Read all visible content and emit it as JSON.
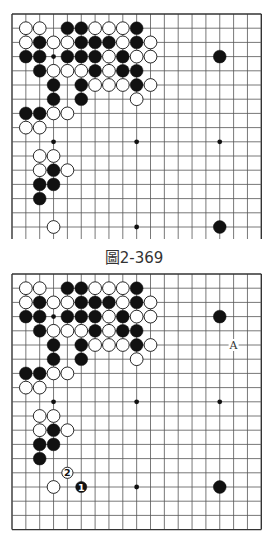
{
  "colors": {
    "background": "#ffffff",
    "grid_line": "#555555",
    "border_line": "#333333",
    "black_stone": "#111111",
    "white_stone": "#ffffff",
    "stone_outline": "#111111",
    "caption_text": "#333333"
  },
  "diagrams": [
    {
      "id": "diagram-1",
      "caption": "圖2-369",
      "board_size": 19,
      "visible_rows": [
        1,
        16
      ],
      "open_bottom": true,
      "star_points": [
        [
          4,
          4
        ],
        [
          10,
          4
        ],
        [
          16,
          4
        ],
        [
          4,
          10
        ],
        [
          10,
          10
        ],
        [
          16,
          10
        ],
        [
          4,
          16
        ],
        [
          10,
          16
        ],
        [
          16,
          16
        ]
      ],
      "stones": [
        {
          "col": 2,
          "row": 2,
          "color": "white"
        },
        {
          "col": 3,
          "row": 2,
          "color": "white"
        },
        {
          "col": 5,
          "row": 2,
          "color": "black"
        },
        {
          "col": 6,
          "row": 2,
          "color": "black"
        },
        {
          "col": 7,
          "row": 2,
          "color": "white"
        },
        {
          "col": 8,
          "row": 2,
          "color": "white"
        },
        {
          "col": 9,
          "row": 2,
          "color": "white"
        },
        {
          "col": 10,
          "row": 2,
          "color": "black"
        },
        {
          "col": 2,
          "row": 3,
          "color": "white"
        },
        {
          "col": 3,
          "row": 3,
          "color": "black"
        },
        {
          "col": 4,
          "row": 3,
          "color": "white"
        },
        {
          "col": 5,
          "row": 3,
          "color": "white"
        },
        {
          "col": 6,
          "row": 3,
          "color": "black"
        },
        {
          "col": 7,
          "row": 3,
          "color": "black"
        },
        {
          "col": 8,
          "row": 3,
          "color": "black"
        },
        {
          "col": 9,
          "row": 3,
          "color": "white"
        },
        {
          "col": 10,
          "row": 3,
          "color": "black"
        },
        {
          "col": 11,
          "row": 3,
          "color": "white"
        },
        {
          "col": 2,
          "row": 4,
          "color": "black"
        },
        {
          "col": 3,
          "row": 4,
          "color": "black"
        },
        {
          "col": 5,
          "row": 4,
          "color": "black"
        },
        {
          "col": 6,
          "row": 4,
          "color": "black"
        },
        {
          "col": 7,
          "row": 4,
          "color": "black"
        },
        {
          "col": 8,
          "row": 4,
          "color": "white"
        },
        {
          "col": 9,
          "row": 4,
          "color": "black"
        },
        {
          "col": 10,
          "row": 4,
          "color": "white"
        },
        {
          "col": 11,
          "row": 4,
          "color": "white"
        },
        {
          "col": 16,
          "row": 4,
          "color": "black"
        },
        {
          "col": 3,
          "row": 5,
          "color": "black"
        },
        {
          "col": 4,
          "row": 5,
          "color": "white"
        },
        {
          "col": 5,
          "row": 5,
          "color": "white"
        },
        {
          "col": 6,
          "row": 5,
          "color": "white"
        },
        {
          "col": 7,
          "row": 5,
          "color": "black"
        },
        {
          "col": 8,
          "row": 5,
          "color": "white"
        },
        {
          "col": 9,
          "row": 5,
          "color": "black"
        },
        {
          "col": 10,
          "row": 5,
          "color": "black"
        },
        {
          "col": 4,
          "row": 6,
          "color": "black"
        },
        {
          "col": 6,
          "row": 6,
          "color": "black"
        },
        {
          "col": 7,
          "row": 6,
          "color": "white"
        },
        {
          "col": 8,
          "row": 6,
          "color": "white"
        },
        {
          "col": 9,
          "row": 6,
          "color": "white"
        },
        {
          "col": 10,
          "row": 6,
          "color": "black"
        },
        {
          "col": 11,
          "row": 6,
          "color": "white"
        },
        {
          "col": 4,
          "row": 7,
          "color": "black"
        },
        {
          "col": 6,
          "row": 7,
          "color": "black"
        },
        {
          "col": 10,
          "row": 7,
          "color": "white"
        },
        {
          "col": 2,
          "row": 8,
          "color": "black"
        },
        {
          "col": 3,
          "row": 8,
          "color": "black"
        },
        {
          "col": 4,
          "row": 8,
          "color": "white"
        },
        {
          "col": 5,
          "row": 8,
          "color": "white"
        },
        {
          "col": 2,
          "row": 9,
          "color": "white"
        },
        {
          "col": 3,
          "row": 9,
          "color": "white"
        },
        {
          "col": 3,
          "row": 11,
          "color": "white"
        },
        {
          "col": 4,
          "row": 11,
          "color": "white"
        },
        {
          "col": 3,
          "row": 12,
          "color": "white"
        },
        {
          "col": 4,
          "row": 12,
          "color": "black"
        },
        {
          "col": 5,
          "row": 12,
          "color": "white"
        },
        {
          "col": 3,
          "row": 13,
          "color": "black"
        },
        {
          "col": 4,
          "row": 13,
          "color": "black"
        },
        {
          "col": 3,
          "row": 14,
          "color": "black"
        },
        {
          "col": 4,
          "row": 16,
          "color": "white"
        },
        {
          "col": 16,
          "row": 16,
          "color": "black"
        }
      ],
      "labels": []
    },
    {
      "id": "diagram-2",
      "caption": "",
      "board_size": 19,
      "visible_rows": [
        1,
        19
      ],
      "open_bottom": false,
      "star_points": [
        [
          4,
          4
        ],
        [
          10,
          4
        ],
        [
          16,
          4
        ],
        [
          4,
          10
        ],
        [
          10,
          10
        ],
        [
          16,
          10
        ],
        [
          4,
          16
        ],
        [
          10,
          16
        ],
        [
          16,
          16
        ]
      ],
      "stones": [
        {
          "col": 2,
          "row": 2,
          "color": "white"
        },
        {
          "col": 3,
          "row": 2,
          "color": "white"
        },
        {
          "col": 5,
          "row": 2,
          "color": "black"
        },
        {
          "col": 6,
          "row": 2,
          "color": "black"
        },
        {
          "col": 7,
          "row": 2,
          "color": "white"
        },
        {
          "col": 8,
          "row": 2,
          "color": "white"
        },
        {
          "col": 9,
          "row": 2,
          "color": "white"
        },
        {
          "col": 10,
          "row": 2,
          "color": "black"
        },
        {
          "col": 2,
          "row": 3,
          "color": "white"
        },
        {
          "col": 3,
          "row": 3,
          "color": "black"
        },
        {
          "col": 4,
          "row": 3,
          "color": "white"
        },
        {
          "col": 5,
          "row": 3,
          "color": "white"
        },
        {
          "col": 6,
          "row": 3,
          "color": "black"
        },
        {
          "col": 7,
          "row": 3,
          "color": "black"
        },
        {
          "col": 8,
          "row": 3,
          "color": "black"
        },
        {
          "col": 9,
          "row": 3,
          "color": "white"
        },
        {
          "col": 10,
          "row": 3,
          "color": "black"
        },
        {
          "col": 11,
          "row": 3,
          "color": "white"
        },
        {
          "col": 2,
          "row": 4,
          "color": "black"
        },
        {
          "col": 3,
          "row": 4,
          "color": "black"
        },
        {
          "col": 5,
          "row": 4,
          "color": "black"
        },
        {
          "col": 6,
          "row": 4,
          "color": "black"
        },
        {
          "col": 7,
          "row": 4,
          "color": "black"
        },
        {
          "col": 8,
          "row": 4,
          "color": "white"
        },
        {
          "col": 9,
          "row": 4,
          "color": "black"
        },
        {
          "col": 10,
          "row": 4,
          "color": "white"
        },
        {
          "col": 11,
          "row": 4,
          "color": "white"
        },
        {
          "col": 16,
          "row": 4,
          "color": "black"
        },
        {
          "col": 3,
          "row": 5,
          "color": "black"
        },
        {
          "col": 4,
          "row": 5,
          "color": "white"
        },
        {
          "col": 5,
          "row": 5,
          "color": "white"
        },
        {
          "col": 6,
          "row": 5,
          "color": "white"
        },
        {
          "col": 7,
          "row": 5,
          "color": "black"
        },
        {
          "col": 8,
          "row": 5,
          "color": "white"
        },
        {
          "col": 9,
          "row": 5,
          "color": "black"
        },
        {
          "col": 10,
          "row": 5,
          "color": "black"
        },
        {
          "col": 4,
          "row": 6,
          "color": "black"
        },
        {
          "col": 6,
          "row": 6,
          "color": "black"
        },
        {
          "col": 7,
          "row": 6,
          "color": "white"
        },
        {
          "col": 8,
          "row": 6,
          "color": "white"
        },
        {
          "col": 9,
          "row": 6,
          "color": "white"
        },
        {
          "col": 10,
          "row": 6,
          "color": "black"
        },
        {
          "col": 11,
          "row": 6,
          "color": "white"
        },
        {
          "col": 4,
          "row": 7,
          "color": "black"
        },
        {
          "col": 6,
          "row": 7,
          "color": "black"
        },
        {
          "col": 10,
          "row": 7,
          "color": "white"
        },
        {
          "col": 2,
          "row": 8,
          "color": "black"
        },
        {
          "col": 3,
          "row": 8,
          "color": "black"
        },
        {
          "col": 4,
          "row": 8,
          "color": "white"
        },
        {
          "col": 5,
          "row": 8,
          "color": "white"
        },
        {
          "col": 2,
          "row": 9,
          "color": "white"
        },
        {
          "col": 3,
          "row": 9,
          "color": "white"
        },
        {
          "col": 3,
          "row": 11,
          "color": "white"
        },
        {
          "col": 4,
          "row": 11,
          "color": "white"
        },
        {
          "col": 3,
          "row": 12,
          "color": "white"
        },
        {
          "col": 4,
          "row": 12,
          "color": "black"
        },
        {
          "col": 5,
          "row": 12,
          "color": "white"
        },
        {
          "col": 3,
          "row": 13,
          "color": "black"
        },
        {
          "col": 4,
          "row": 13,
          "color": "black"
        },
        {
          "col": 3,
          "row": 14,
          "color": "black"
        },
        {
          "col": 5,
          "row": 15,
          "color": "white",
          "number": "2"
        },
        {
          "col": 4,
          "row": 16,
          "color": "white"
        },
        {
          "col": 6,
          "row": 16,
          "color": "black",
          "number": "1"
        },
        {
          "col": 16,
          "row": 16,
          "color": "black"
        }
      ],
      "labels": [
        {
          "col": 17,
          "row": 6,
          "text": "A"
        }
      ]
    }
  ]
}
